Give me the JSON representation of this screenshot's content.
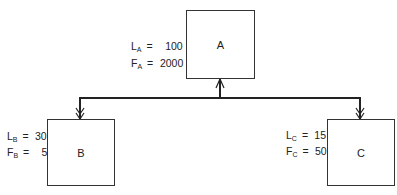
{
  "diagram": {
    "type": "tree",
    "nodes": [
      {
        "id": "A",
        "label": "A",
        "params": [
          {
            "symbol": "L",
            "subscript": "A",
            "value": "100"
          },
          {
            "symbol": "F",
            "subscript": "A",
            "value": "2000"
          }
        ]
      },
      {
        "id": "B",
        "label": "B",
        "params": [
          {
            "symbol": "L",
            "subscript": "B",
            "value": "30"
          },
          {
            "symbol": "F",
            "subscript": "B",
            "value": "5"
          }
        ]
      },
      {
        "id": "C",
        "label": "C",
        "params": [
          {
            "symbol": "L",
            "subscript": "C",
            "value": "15"
          },
          {
            "symbol": "F",
            "subscript": "C",
            "value": "50"
          }
        ]
      }
    ],
    "edges": [
      {
        "from": "bus",
        "to": "A",
        "arrow": "single"
      },
      {
        "from": "bus",
        "to": "B",
        "arrow": "double"
      },
      {
        "from": "bus",
        "to": "C",
        "arrow": "double"
      }
    ],
    "colors": {
      "line": "#222222",
      "box_border": "#333333",
      "text": "#222222"
    }
  },
  "equals": "="
}
